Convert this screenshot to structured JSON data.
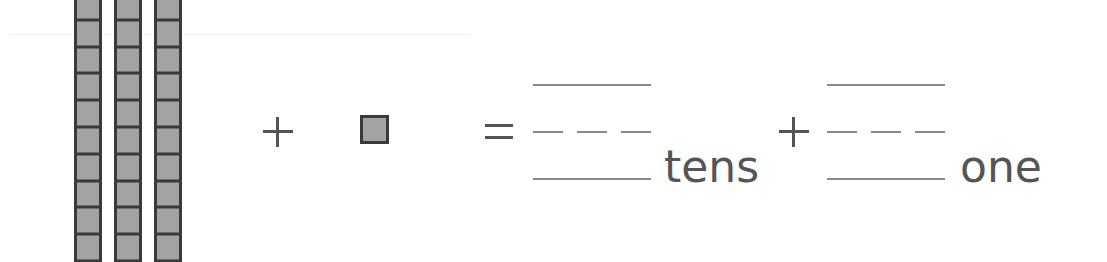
{
  "worksheet": {
    "tens_rods": {
      "count": 3,
      "cells_per_rod": 10
    },
    "ones_cubes": {
      "count": 1
    },
    "operator_plus": "+",
    "operator_equals": "=",
    "answer_tens": {
      "value": "",
      "label": "tens"
    },
    "answer_ones": {
      "value": "",
      "label": "one"
    },
    "colors": {
      "block_fill": "#a3a3a3",
      "block_border": "#3a3a3a",
      "text": "#555555",
      "writing_line": "#8a8a8a"
    }
  }
}
